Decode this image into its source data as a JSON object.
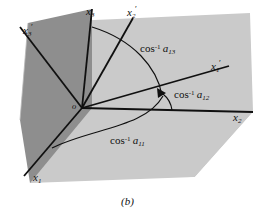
{
  "figure": {
    "caption": "(b)",
    "origin_label": "o",
    "background_color": "#ffffff",
    "plane_dark_color": "#8e8e8e",
    "plane_light_color": "#cacaca",
    "line_color": "#101010",
    "text_color": "#101010"
  },
  "axes": [
    {
      "id": "x1",
      "label_base": "x",
      "label_sub": "1",
      "primed": false,
      "label_x": 33,
      "label_y": 178
    },
    {
      "id": "x2",
      "label_base": "x",
      "label_sub": "2",
      "primed": false,
      "label_x": 233,
      "label_y": 115
    },
    {
      "id": "x3",
      "label_base": "x",
      "label_sub": "3",
      "primed": false,
      "label_x": 86,
      "label_y": 8
    },
    {
      "id": "x1prime",
      "label_base": "x",
      "label_sub": "1",
      "primed": true,
      "label_x": 212,
      "label_y": 65
    },
    {
      "id": "x2prime",
      "label_base": "x",
      "label_sub": "2",
      "primed": true,
      "label_x": 128,
      "label_y": 10
    },
    {
      "id": "x3prime",
      "label_base": "x",
      "label_sub": "3",
      "primed": true,
      "label_x": 24,
      "label_y": 28
    }
  ],
  "annotations": [
    {
      "id": "a13",
      "fn": "cos",
      "exp": "-1",
      "coef_base": "a",
      "coef_sub": "13",
      "label_x": 140,
      "label_y": 49
    },
    {
      "id": "a12",
      "fn": "cos",
      "exp": "-1",
      "coef_base": "a",
      "coef_sub": "12",
      "label_x": 175,
      "label_y": 95
    },
    {
      "id": "a11",
      "fn": "cos",
      "exp": "-1",
      "coef_base": "a",
      "coef_sub": "11",
      "label_x": 110,
      "label_y": 141
    }
  ],
  "geometry": {
    "origin": {
      "x": 82,
      "y": 108
    },
    "axis_endpoints": {
      "x1": {
        "x": 24,
        "y": 176
      },
      "x2": {
        "x": 253,
        "y": 112
      },
      "x3": {
        "x": 92,
        "y": 9
      },
      "x1prime": {
        "x": 229,
        "y": 66
      },
      "x2prime": {
        "x": 133,
        "y": 18
      },
      "x3prime": {
        "x": 20,
        "y": 27
      }
    }
  }
}
